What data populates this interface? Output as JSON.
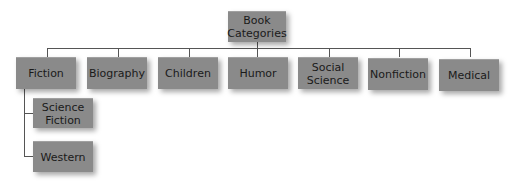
{
  "diagram": {
    "type": "tree",
    "root": {
      "label": "Book Categories"
    },
    "categories": [
      {
        "label": "Fiction",
        "children": [
          {
            "label": "Science Fiction"
          },
          {
            "label": "Western"
          }
        ]
      },
      {
        "label": "Biography"
      },
      {
        "label": "Children"
      },
      {
        "label": "Humor"
      },
      {
        "label": "Social Science"
      },
      {
        "label": "Nonfiction"
      },
      {
        "label": "Medical"
      }
    ],
    "colors": {
      "box": "#8a8a8a",
      "text": "#1a1a1a",
      "connector": "#555555"
    }
  }
}
